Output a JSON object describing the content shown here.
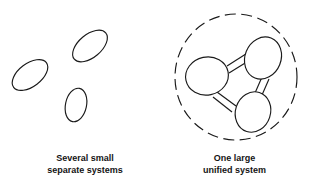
{
  "diagram": {
    "background_color": "#ffffff",
    "stroke_color": "#1a1a1a",
    "panels": [
      {
        "id": "left",
        "caption_line_1": "Several small",
        "caption_line_2": "separate systems",
        "shape_count": 3,
        "shapes": [
          {
            "name": "small-system-ellipse-top-right",
            "cx": 90,
            "cy": 46,
            "rx": 20.5,
            "ry": 11.5,
            "rotation": -40
          },
          {
            "name": "small-system-ellipse-left",
            "cx": 30,
            "cy": 75,
            "rx": 20.5,
            "ry": 11.5,
            "rotation": -37
          },
          {
            "name": "small-system-ellipse-bottom",
            "cx": 76,
            "cy": 105,
            "rx": 17,
            "ry": 10.5,
            "rotation": -78
          }
        ]
      },
      {
        "id": "right",
        "caption_line_1": "One large",
        "caption_line_2": "unified system",
        "boundary": {
          "name": "unified-system-boundary",
          "cx": 236,
          "cy": 77,
          "rx": 61,
          "ry": 63,
          "style": "dashed"
        },
        "shape_count": 3,
        "shapes": [
          {
            "name": "unified-node-left",
            "cx": 207,
            "cy": 76,
            "rx": 21.5,
            "ry": 19,
            "rotation": -12
          },
          {
            "name": "unified-node-top-right",
            "cx": 263,
            "cy": 58,
            "rx": 18,
            "ry": 21.5,
            "rotation": 22
          },
          {
            "name": "unified-node-bottom-right",
            "cx": 253,
            "cy": 112,
            "rx": 17.5,
            "ry": 20.5,
            "rotation": 18
          }
        ],
        "connector_count": 3,
        "connectors": [
          {
            "name": "connector-left-to-top-right"
          },
          {
            "name": "connector-top-right-to-bottom-right"
          },
          {
            "name": "connector-bottom-right-to-left"
          }
        ]
      }
    ]
  }
}
